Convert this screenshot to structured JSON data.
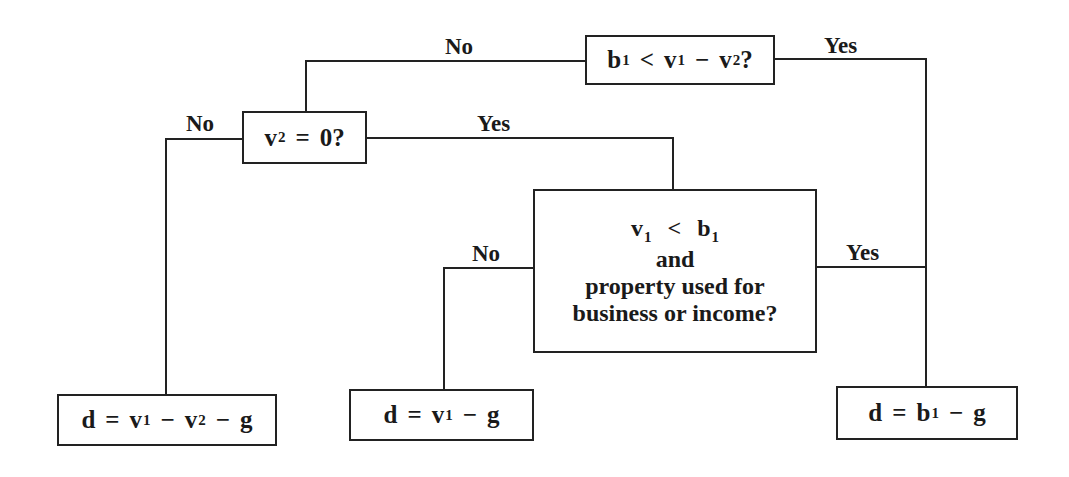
{
  "diagram": {
    "type": "decision-tree",
    "nodes": {
      "root": {
        "parts": [
          "b",
          "1",
          "<",
          "v",
          "1",
          "−",
          "v",
          "2",
          "?"
        ],
        "text": "b1 < v1 − v2?"
      },
      "v2_zero": {
        "parts": [
          "v",
          "2",
          "=",
          "0?"
        ],
        "text": "v2 = 0?"
      },
      "v1_lt_b1": {
        "line1": [
          "v",
          "1",
          "<",
          "b",
          "1"
        ],
        "line2": "and",
        "line3": "property used for",
        "line4": "business or income?",
        "text": "v1 < b1 and property used for business or income?"
      },
      "result_left": {
        "parts": [
          "d",
          "=",
          "v",
          "1",
          "−",
          "v",
          "2",
          "−",
          "g"
        ],
        "text": "d = v1 − v2 − g"
      },
      "result_middle": {
        "parts": [
          "d",
          "=",
          "v",
          "1",
          "−",
          "g"
        ],
        "text": "d = v1 − g"
      },
      "result_right": {
        "parts": [
          "d",
          "=",
          "b",
          "1",
          "−",
          "g"
        ],
        "text": "d = b1 − g"
      }
    },
    "edges": [
      {
        "from": "root",
        "to": "v2_zero",
        "label": "No"
      },
      {
        "from": "root",
        "to": "result_right",
        "label": "Yes"
      },
      {
        "from": "v2_zero",
        "to": "result_left",
        "label": "No"
      },
      {
        "from": "v2_zero",
        "to": "v1_lt_b1",
        "label": "Yes"
      },
      {
        "from": "v1_lt_b1",
        "to": "result_middle",
        "label": "No"
      },
      {
        "from": "v1_lt_b1",
        "to": "result_right",
        "label": "Yes"
      }
    ],
    "colors": {
      "line": "#222222",
      "text": "#1a1a1a",
      "background": "#ffffff"
    }
  }
}
